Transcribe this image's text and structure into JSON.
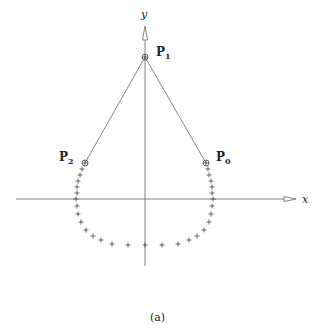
{
  "figure": {
    "caption": "(a)",
    "axes": {
      "x_label": "x",
      "y_label": "y",
      "origin_px": [
        145,
        199
      ]
    },
    "control_points": [
      {
        "name": "P",
        "sub": "0",
        "px": [
          206,
          163
        ]
      },
      {
        "name": "P",
        "sub": "1",
        "px": [
          145,
          57
        ]
      },
      {
        "name": "P",
        "sub": "2",
        "px": [
          85,
          163
        ]
      }
    ],
    "curve_marker": "+",
    "curve_points_px": [
      [
        85,
        163
      ],
      [
        82,
        169
      ],
      [
        80,
        175
      ],
      [
        78,
        181
      ],
      [
        77,
        187
      ],
      [
        77,
        193
      ],
      [
        76,
        199
      ],
      [
        77,
        206
      ],
      [
        78,
        214
      ],
      [
        81,
        222
      ],
      [
        86,
        230
      ],
      [
        93,
        236
      ],
      [
        101,
        240
      ],
      [
        112,
        244
      ],
      [
        128,
        245
      ],
      [
        145,
        245
      ],
      [
        162,
        245
      ],
      [
        178,
        244
      ],
      [
        189,
        240
      ],
      [
        197,
        236
      ],
      [
        204,
        230
      ],
      [
        209,
        222
      ],
      [
        211,
        214
      ],
      [
        212,
        206
      ],
      [
        213,
        199
      ],
      [
        212,
        193
      ],
      [
        212,
        187
      ],
      [
        211,
        181
      ],
      [
        209,
        175
      ],
      [
        208,
        169
      ],
      [
        206,
        163
      ]
    ],
    "colors": {
      "axis": "#777777",
      "control_lines": "#666666",
      "markers": "#444444",
      "text": "#222222"
    }
  }
}
